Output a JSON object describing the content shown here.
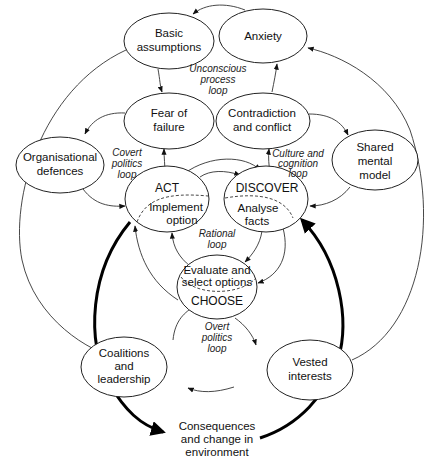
{
  "diagram": {
    "nodes": {
      "basic_assumptions": {
        "line1": "Basic",
        "line2": "assumptions"
      },
      "anxiety": {
        "line1": "Anxiety"
      },
      "fear_of_failure": {
        "line1": "Fear of",
        "line2": "failure"
      },
      "contradiction": {
        "line1": "Contradiction",
        "line2": "and conflict"
      },
      "org_defences": {
        "line1": "Organisational",
        "line2": "defences"
      },
      "shared_model": {
        "line1": "Shared",
        "line2": "mental",
        "line3": "model"
      },
      "act": {
        "title": "ACT",
        "line1": "Implement",
        "line2": "option"
      },
      "discover": {
        "title": "DISCOVER",
        "line1": "Analyse",
        "line2": "facts"
      },
      "choose": {
        "title": "CHOOSE",
        "line1": "Evaluate and",
        "line2": "select options"
      },
      "coalitions": {
        "line1": "Coalitions",
        "line2": "and",
        "line3": "leadership"
      },
      "vested": {
        "line1": "Vested",
        "line2": "interests"
      },
      "consequences": {
        "line1": "Consequences",
        "line2": "and change in",
        "line3": "environment"
      }
    },
    "loops": {
      "unconscious": {
        "line1": "Unconscious",
        "line2": "process",
        "line3": "loop"
      },
      "covert": {
        "line1": "Covert",
        "line2": "politics",
        "line3": "loop"
      },
      "culture": {
        "line1": "Culture and",
        "line2": "cognition",
        "line3": "loop"
      },
      "rational": {
        "line1": "Rational",
        "line2": "loop"
      },
      "overt": {
        "line1": "Overt",
        "line2": "politics",
        "line3": "loop"
      }
    }
  }
}
